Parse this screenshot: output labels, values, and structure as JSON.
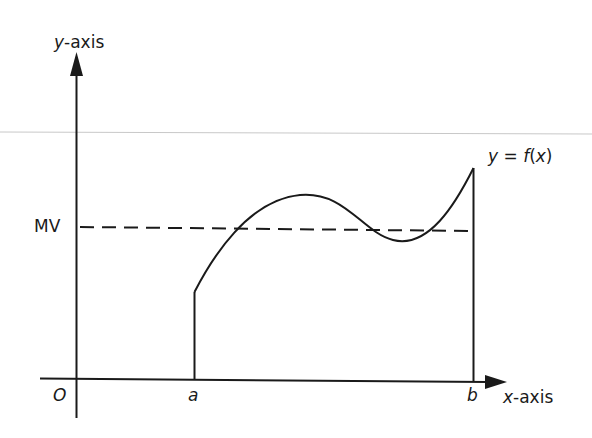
{
  "diagram": {
    "labels": {
      "y_axis_var": "y",
      "y_axis_suffix": "-axis",
      "x_axis_var": "x",
      "x_axis_suffix": "-axis",
      "origin": "O",
      "a": "a",
      "b": "b",
      "mv": "MV",
      "function_y": "y",
      "function_eq": " = ",
      "function_f": "f",
      "function_open": "(",
      "function_x": "x",
      "function_close": ")"
    },
    "colors": {
      "ink": "#1a1a1a",
      "background": "#ffffff",
      "rule_line": "#c8c8c8"
    }
  }
}
